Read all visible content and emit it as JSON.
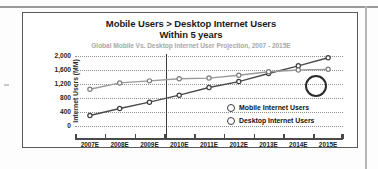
{
  "chart_data": {
    "type": "line",
    "title": "Mobile Users > Desktop Internet Users",
    "title_line2": "Within 5 years",
    "subtitle": "Global Mobile Vs. Desktop Internet User Projection, 2007 - 2015E",
    "xlabel": "",
    "ylabel": "Internet Users (MM)",
    "categories": [
      "2007E",
      "2008E",
      "2009E",
      "2010E",
      "2011E",
      "2012E",
      "2013E",
      "2014E",
      "2015E"
    ],
    "ylim": [
      0,
      2000
    ],
    "yticks": [
      2000,
      1600,
      1200,
      800,
      400,
      0
    ],
    "ytick_labels": [
      "2,000",
      "1,600",
      "1,200",
      "800",
      "400",
      "0"
    ],
    "grid": true,
    "legend_position": "inside-right",
    "series": [
      {
        "name": "Mobile Internet Users",
        "color": "#4a4a4a",
        "values": [
          300,
          500,
          680,
          880,
          1100,
          1270,
          1500,
          1720,
          1950
        ]
      },
      {
        "name": "Desktop Internet Users",
        "color": "#9a9a9a",
        "values": [
          1050,
          1230,
          1290,
          1350,
          1370,
          1450,
          1550,
          1600,
          1620
        ]
      }
    ],
    "annotations": [
      {
        "name": "crossover-circle",
        "type": "ellipse",
        "x_category": "2013E-2014E",
        "note": "crossover highlight"
      },
      {
        "name": "today-marker",
        "type": "vline",
        "x_position": 2.55,
        "note": "vertical reference line"
      }
    ]
  },
  "legend": {
    "items": [
      {
        "label": "Mobile Internet Users"
      },
      {
        "label": "Desktop Internet Users"
      }
    ]
  }
}
